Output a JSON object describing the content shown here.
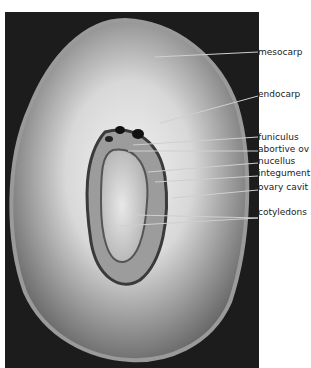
{
  "figure": {
    "labels": [
      {
        "id": "mesocarp",
        "text": "mesocarp",
        "y": 52
      },
      {
        "id": "endocarp",
        "text": "endocarp",
        "y": 94
      },
      {
        "id": "funiculus",
        "text": "funiculus",
        "y": 137
      },
      {
        "id": "abortive-ovule",
        "text": "abortive ov",
        "y": 149
      },
      {
        "id": "nucellus",
        "text": "nucellus",
        "y": 161
      },
      {
        "id": "integument",
        "text": "integument",
        "y": 173
      },
      {
        "id": "ovary-cavity",
        "text": "ovary cavit",
        "y": 187
      },
      {
        "id": "cotyledons",
        "text": "cotyledons",
        "y": 212
      }
    ]
  }
}
